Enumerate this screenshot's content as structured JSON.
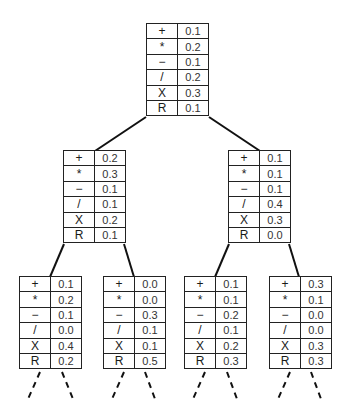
{
  "diagram": {
    "type": "probability-tree",
    "operators": [
      "+",
      "*",
      "−",
      "/",
      "X",
      "R"
    ],
    "nodes": [
      {
        "id": "root",
        "level": 0,
        "x": 146,
        "y": 23,
        "values": [
          "0.1",
          "0.2",
          "0.1",
          "0.2",
          "0.3",
          "0.1"
        ]
      },
      {
        "id": "l",
        "level": 1,
        "x": 63,
        "y": 150,
        "values": [
          "0.2",
          "0.3",
          "0.1",
          "0.1",
          "0.2",
          "0.1"
        ]
      },
      {
        "id": "r",
        "level": 1,
        "x": 228,
        "y": 150,
        "values": [
          "0.1",
          "0.1",
          "0.1",
          "0.4",
          "0.3",
          "0.0"
        ]
      },
      {
        "id": "ll",
        "level": 2,
        "x": 19,
        "y": 276,
        "values": [
          "0.1",
          "0.2",
          "0.1",
          "0.0",
          "0.4",
          "0.2"
        ]
      },
      {
        "id": "lr",
        "level": 2,
        "x": 103,
        "y": 276,
        "values": [
          "0.0",
          "0.0",
          "0.3",
          "0.1",
          "0.1",
          "0.5"
        ]
      },
      {
        "id": "rl",
        "level": 2,
        "x": 184,
        "y": 276,
        "values": [
          "0.1",
          "0.1",
          "0.2",
          "0.1",
          "0.2",
          "0.3"
        ]
      },
      {
        "id": "rr",
        "level": 2,
        "x": 269,
        "y": 276,
        "values": [
          "0.3",
          "0.1",
          "0.0",
          "0.0",
          "0.3",
          "0.3"
        ]
      }
    ],
    "edges": [
      {
        "x1": 146,
        "y1": 117,
        "x2": 95,
        "y2": 151,
        "style": "solid"
      },
      {
        "x1": 209,
        "y1": 117,
        "x2": 260,
        "y2": 151,
        "style": "solid"
      },
      {
        "x1": 64,
        "y1": 244,
        "x2": 50,
        "y2": 277,
        "style": "solid"
      },
      {
        "x1": 124,
        "y1": 244,
        "x2": 134,
        "y2": 277,
        "style": "solid"
      },
      {
        "x1": 229,
        "y1": 244,
        "x2": 215,
        "y2": 277,
        "style": "solid"
      },
      {
        "x1": 289,
        "y1": 244,
        "x2": 299,
        "y2": 277,
        "style": "solid"
      },
      {
        "x1": 40,
        "y1": 372,
        "x2": 28,
        "y2": 399,
        "style": "dashed"
      },
      {
        "x1": 62,
        "y1": 372,
        "x2": 73,
        "y2": 399,
        "style": "dashed"
      },
      {
        "x1": 124,
        "y1": 372,
        "x2": 112,
        "y2": 399,
        "style": "dashed"
      },
      {
        "x1": 145,
        "y1": 372,
        "x2": 155,
        "y2": 399,
        "style": "dashed"
      },
      {
        "x1": 205,
        "y1": 372,
        "x2": 193,
        "y2": 399,
        "style": "dashed"
      },
      {
        "x1": 227,
        "y1": 372,
        "x2": 237,
        "y2": 399,
        "style": "dashed"
      },
      {
        "x1": 290,
        "y1": 372,
        "x2": 278,
        "y2": 399,
        "style": "dashed"
      },
      {
        "x1": 311,
        "y1": 372,
        "x2": 321,
        "y2": 399,
        "style": "dashed"
      }
    ]
  }
}
